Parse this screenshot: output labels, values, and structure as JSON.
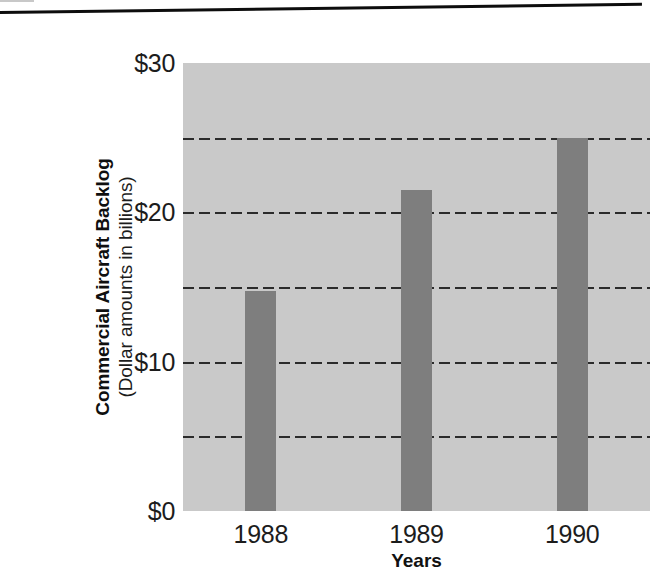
{
  "chart_data": {
    "type": "bar",
    "title": "",
    "categories": [
      "1988",
      "1989",
      "1990"
    ],
    "values": [
      14.7,
      21.5,
      25.0
    ],
    "xlabel": "Years",
    "ylabel": "Commercial Aircraft Backlog",
    "ylabel_sub": "(Dollar amounts in billions)",
    "ylim": [
      0,
      30
    ],
    "ytick_labels": [
      "$30",
      "$20",
      "$10",
      "$0"
    ],
    "ytick_values": [
      30,
      20,
      10,
      0
    ],
    "gridlines": {
      "shown": true,
      "style": "dashed",
      "values": [
        25,
        20,
        15,
        10,
        5
      ]
    },
    "legend": {
      "shown": false,
      "position": "none"
    },
    "colors": {
      "bar": "#7e7e7e",
      "plot_background": "#c9c9c9",
      "gridline": "#2b2b2b",
      "text": "#1c1c1c",
      "page_background": "#ffffff",
      "scan_line": "#0d0d0d"
    }
  },
  "artifacts": {
    "scan_line_label": "horizontal-black-scan-rule"
  }
}
